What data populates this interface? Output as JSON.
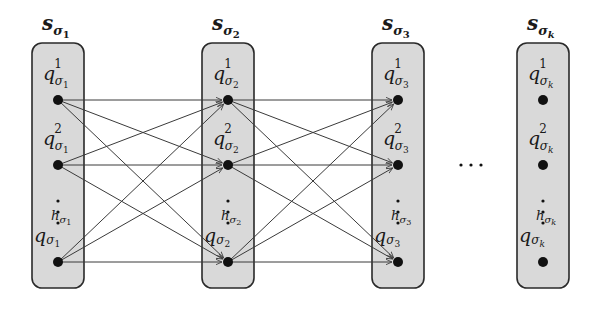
{
  "diagram": {
    "type": "layered-state-graph",
    "colors": {
      "box_fill": "#d9d9d9",
      "box_stroke": "#2a2a2a",
      "node": "#111111",
      "edge": "#3a3a3a"
    },
    "columns": [
      {
        "id": "s1",
        "title": {
          "base": "s",
          "sub": "σ",
          "subsub": "1"
        },
        "x": 58,
        "states": [
          {
            "label": {
              "base": "q",
              "sup": "1",
              "sub": "σ",
              "subsub": "1"
            },
            "y": 100
          },
          {
            "label": {
              "base": "q",
              "sup": "2",
              "sub": "σ",
              "subsub": "1"
            },
            "y": 165
          },
          {
            "label": {
              "base": "q",
              "sup": "hσ1",
              "sup_base": "h",
              "sup_sub": "σ",
              "sup_subsub": "1",
              "sub": "σ",
              "subsub": "1"
            },
            "y": 262
          }
        ]
      },
      {
        "id": "s2",
        "title": {
          "base": "s",
          "sub": "σ",
          "subsub": "2"
        },
        "x": 228,
        "states": [
          {
            "label": {
              "base": "q",
              "sup": "1",
              "sub": "σ",
              "subsub": "2"
            },
            "y": 100
          },
          {
            "label": {
              "base": "q",
              "sup": "2",
              "sub": "σ",
              "subsub": "2"
            },
            "y": 165
          },
          {
            "label": {
              "base": "q",
              "sup": "hσ2",
              "sup_base": "h",
              "sup_sub": "σ",
              "sup_subsub": "2",
              "sub": "σ",
              "subsub": "2"
            },
            "y": 262
          }
        ]
      },
      {
        "id": "s3",
        "title": {
          "base": "s",
          "sub": "σ",
          "subsub": "3"
        },
        "x": 398,
        "states": [
          {
            "label": {
              "base": "q",
              "sup": "1",
              "sub": "σ",
              "subsub": "3"
            },
            "y": 100
          },
          {
            "label": {
              "base": "q",
              "sup": "2",
              "sub": "σ",
              "subsub": "3"
            },
            "y": 165
          },
          {
            "label": {
              "base": "q",
              "sup": "hσ3",
              "sup_base": "h",
              "sup_sub": "σ",
              "sup_subsub": "3",
              "sub": "σ",
              "subsub": "3"
            },
            "y": 262
          }
        ]
      },
      {
        "id": "sk",
        "title": {
          "base": "s",
          "sub": "σ",
          "subsub": "k"
        },
        "x": 543,
        "states": [
          {
            "label": {
              "base": "q",
              "sup": "1",
              "sub": "σ",
              "subsub": "k"
            },
            "y": 100
          },
          {
            "label": {
              "base": "q",
              "sup": "2",
              "sub": "σ",
              "subsub": "k"
            },
            "y": 165
          },
          {
            "label": {
              "base": "q",
              "sup": "hσk",
              "sup_base": "h",
              "sup_sub": "σ",
              "sup_subsub": "k",
              "sub": "σ",
              "subsub": "k"
            },
            "y": 262
          }
        ]
      }
    ],
    "vertical_ellipsis": "⋮",
    "horizontal_ellipsis": "· · ·",
    "edges": "complete bipartite between adjacent columns s1→s2, s2→s3 (arrows into target states)"
  }
}
